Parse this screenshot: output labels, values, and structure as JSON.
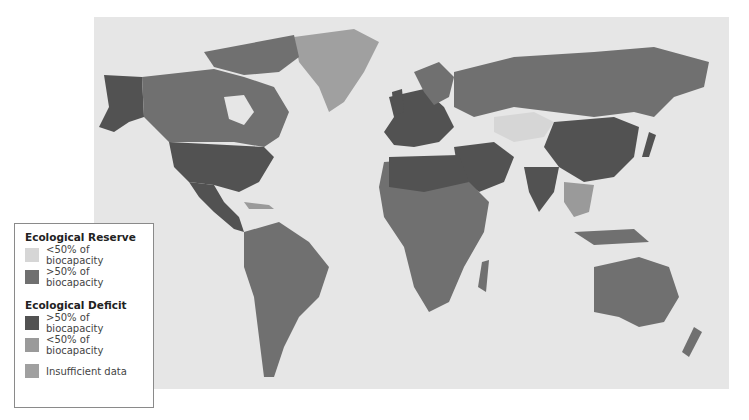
{
  "map": {
    "background_color": "#e6e6e6",
    "regions": [
      {
        "name": "North America (Alaska)",
        "category": "deficit_high"
      },
      {
        "name": "Canada",
        "category": "reserve_high"
      },
      {
        "name": "Greenland",
        "category": "insufficient"
      },
      {
        "name": "United States",
        "category": "deficit_high"
      },
      {
        "name": "Mexico",
        "category": "deficit_high"
      },
      {
        "name": "South America",
        "category": "reserve_high"
      },
      {
        "name": "Europe",
        "category": "deficit_high"
      },
      {
        "name": "Russia",
        "category": "reserve_high"
      },
      {
        "name": "Kazakhstan",
        "category": "reserve_low"
      },
      {
        "name": "China",
        "category": "deficit_high"
      },
      {
        "name": "Middle East",
        "category": "deficit_high"
      },
      {
        "name": "India",
        "category": "deficit_high"
      },
      {
        "name": "Africa",
        "category": "reserve_high"
      },
      {
        "name": "Australia",
        "category": "reserve_high"
      },
      {
        "name": "Japan",
        "category": "deficit_high"
      }
    ]
  },
  "legend": {
    "reserve_title": "Ecological Reserve",
    "deficit_title": "Ecological Deficit",
    "items": {
      "reserve_low": {
        "label": "<50% of biocapacity",
        "color": "#d6d6d6"
      },
      "reserve_high": {
        "label": ">50% of biocapacity",
        "color": "#707070"
      },
      "deficit_high": {
        "label": ">50% of biocapacity",
        "color": "#525252"
      },
      "deficit_low": {
        "label": "<50% of biocapacity",
        "color": "#9a9a9a"
      },
      "insufficient": {
        "label": "Insufficient data",
        "color": "#a0a0a0"
      }
    }
  }
}
